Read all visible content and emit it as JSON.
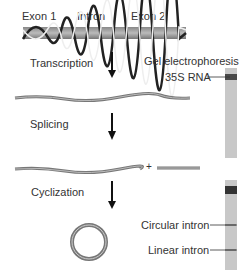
{
  "gene_labels": {
    "exon1": "Exon 1",
    "intron": "Intron",
    "exon2": "Exon 2"
  },
  "steps": [
    "Transcription",
    "Splicing",
    "Cyclization"
  ],
  "plus_sign": "+",
  "gel": {
    "title": "Gel electrophoresis",
    "bands": [
      "35S RNA",
      "Circular intron",
      "Linear intron"
    ]
  },
  "colors": {
    "strand": "#777777",
    "arrow": "#111111",
    "gel": "#c8c8c8",
    "band": "#333333"
  }
}
